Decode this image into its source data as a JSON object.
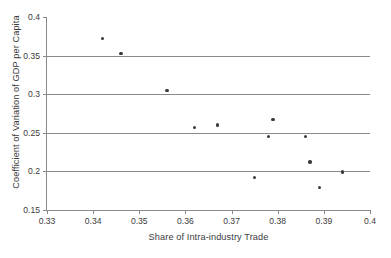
{
  "chart_data": {
    "type": "scatter",
    "title": "",
    "xlabel": "Share of Intra-industry Trade",
    "ylabel": "Coefficient of Variation of GDP per Capita",
    "xlim": [
      0.33,
      0.4
    ],
    "ylim": [
      0.15,
      0.4
    ],
    "xticks": [
      0.33,
      0.34,
      0.35,
      0.36,
      0.37,
      0.38,
      0.39,
      0.4
    ],
    "xtick_labels": [
      "0.33",
      "0.34",
      "0.35",
      "0.36",
      "0.37",
      "0.38",
      "0.39",
      "0.4"
    ],
    "yticks": [
      0.15,
      0.2,
      0.25,
      0.3,
      0.35,
      0.4
    ],
    "ytick_labels": [
      "0.15",
      "0.2",
      "0.25",
      "0.3",
      "0.35",
      "0.4"
    ],
    "grid": "horizontal",
    "gridlines_y": [
      0.2,
      0.25,
      0.3,
      0.35
    ],
    "legend": null,
    "marker_color": "#3a3a3a",
    "axis_color": "#8a8a8a",
    "text_color": "#3b3b3b",
    "background": "#ffffff",
    "x": [
      0.342,
      0.346,
      0.356,
      0.362,
      0.367,
      0.375,
      0.378,
      0.379,
      0.386,
      0.387,
      0.389,
      0.394
    ],
    "y": [
      0.372,
      0.353,
      0.305,
      0.257,
      0.26,
      0.192,
      0.245,
      0.267,
      0.245,
      0.212,
      0.179,
      0.199
    ],
    "points": [
      {
        "x": 0.342,
        "y": 0.372
      },
      {
        "x": 0.346,
        "y": 0.353
      },
      {
        "x": 0.356,
        "y": 0.305
      },
      {
        "x": 0.362,
        "y": 0.257
      },
      {
        "x": 0.367,
        "y": 0.26
      },
      {
        "x": 0.375,
        "y": 0.192
      },
      {
        "x": 0.378,
        "y": 0.245
      },
      {
        "x": 0.379,
        "y": 0.267
      },
      {
        "x": 0.386,
        "y": 0.245
      },
      {
        "x": 0.387,
        "y": 0.212
      },
      {
        "x": 0.389,
        "y": 0.179
      },
      {
        "x": 0.394,
        "y": 0.199
      }
    ]
  }
}
